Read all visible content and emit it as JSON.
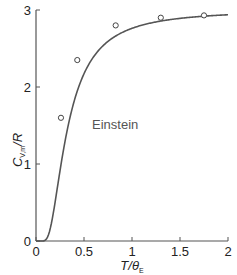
{
  "chart_data": {
    "type": "line",
    "title": "",
    "xlabel": "T/θE",
    "ylabel": "CV,m/R",
    "xlim": [
      0,
      2
    ],
    "ylim": [
      0,
      3
    ],
    "x_ticks": [
      "0",
      "0.5",
      "1",
      "1.5",
      "2"
    ],
    "y_ticks": [
      "0",
      "1",
      "2",
      "3"
    ],
    "grid": false,
    "legend": null,
    "series": [
      {
        "name": "Einstein",
        "kind": "line",
        "description": "Einstein model heat capacity curve, C/3R = (1/t)^2 e^(1/t) / (e^(1/t)-1)^2 with t = T/θE",
        "x": [
          0.05,
          0.1,
          0.15,
          0.2,
          0.25,
          0.3,
          0.4,
          0.5,
          0.6,
          0.8,
          1.0,
          1.25,
          1.5,
          1.75,
          2.0
        ],
        "values": [
          0.0,
          0.014,
          0.17,
          0.51,
          0.88,
          1.22,
          1.76,
          2.12,
          2.37,
          2.64,
          2.76,
          2.84,
          2.89,
          2.92,
          2.94
        ]
      },
      {
        "name": "Experimental data",
        "kind": "scatter",
        "marker": "open-circle",
        "x": [
          0.26,
          0.43,
          0.83,
          1.3,
          1.75
        ],
        "values": [
          1.6,
          2.35,
          2.8,
          2.9,
          2.93
        ]
      }
    ],
    "annotations": [
      {
        "text": "Einstein",
        "x": 0.55,
        "y": 1.95
      }
    ]
  },
  "labels": {
    "y_title_main": "C",
    "y_title_sub": "V,m",
    "y_title_rest": "/R",
    "x_title_main": "T/θ",
    "x_title_sub": "E",
    "curve_label": "Einstein"
  },
  "colors": {
    "axis": "#555555",
    "curve": "#555555",
    "marker": "#444444",
    "text": "#222222"
  }
}
